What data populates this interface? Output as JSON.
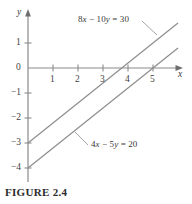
{
  "figure": {
    "caption": "FIGURE 2.4",
    "background_color": "#ffffff",
    "line_color": "#8d8d8d",
    "axis_color": "#8a8a8a",
    "text_color": "#3b3b3b"
  },
  "axes": {
    "x_axis_label": "x",
    "y_axis_label": "y",
    "x_tick_labels": [
      "1",
      "2",
      "3",
      "4",
      "5"
    ],
    "y_tick_labels": [
      "1",
      "0",
      "−1",
      "−2",
      "−3",
      "−4"
    ],
    "origin_label": "0"
  },
  "annotations": {
    "line1_label_html": "8<i>x</i> − 10<i>y</i> = 30",
    "line1_label_text": "8x − 10y = 30",
    "line2_label_html": "4<i>x</i> − 5<i>y</i> = 20",
    "line2_label_text": "4x − 5y = 20"
  },
  "chart_data": {
    "type": "line",
    "title": "FIGURE 2.4",
    "xlabel": "x",
    "ylabel": "y",
    "xlim": [
      -0.25,
      6.1
    ],
    "ylim": [
      -4.6,
      1.85
    ],
    "grid": false,
    "legend": "annotated-inline",
    "x_ticks": [
      1,
      2,
      3,
      4,
      5
    ],
    "y_ticks": [
      1,
      0,
      -1,
      -2,
      -3,
      -4
    ],
    "series": [
      {
        "name": "8x - 10y = 30",
        "equation": "8x − 10y = 30",
        "slope": 0.8,
        "y_intercept": -3,
        "x_intercept": 3.75,
        "points": [
          [
            0,
            -3
          ],
          [
            6,
            1.8
          ]
        ],
        "label_position": [
          3.0,
          1.55
        ],
        "leader_from": [
          4.6,
          1.25
        ],
        "leader_to": [
          5.2,
          0.75
        ]
      },
      {
        "name": "4x - 5y = 20",
        "equation": "4x − 5y = 20",
        "slope": 0.8,
        "y_intercept": -4,
        "x_intercept": 5.0,
        "points": [
          [
            0,
            -4
          ],
          [
            6,
            0.8
          ]
        ],
        "label_position": [
          2.7,
          -2.95
        ],
        "leader_from": [
          2.55,
          -2.6
        ],
        "leader_to": [
          2.1,
          -2.2
        ]
      }
    ]
  }
}
